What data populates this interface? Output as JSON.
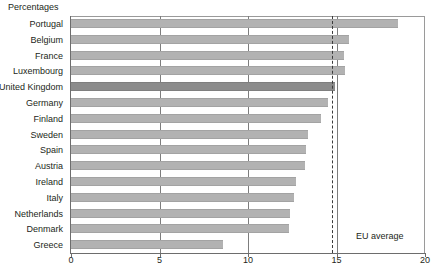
{
  "chart_data": {
    "type": "bar",
    "orientation": "horizontal",
    "title": "Percentages",
    "xlabel": "",
    "ylabel": "",
    "categories": [
      "Portugal",
      "Belgium",
      "France",
      "Luxembourg",
      "United Kingdom",
      "Germany",
      "Finland",
      "Sweden",
      "Spain",
      "Austria",
      "Ireland",
      "Italy",
      "Netherlands",
      "Denmark",
      "Greece"
    ],
    "values": [
      18.5,
      15.7,
      15.4,
      15.5,
      14.9,
      14.5,
      14.1,
      13.4,
      13.3,
      13.2,
      12.7,
      12.6,
      12.4,
      12.3,
      8.6
    ],
    "highlight_category": "United Kingdom",
    "xlim": [
      0,
      20
    ],
    "xticks": [
      0,
      5,
      10,
      15,
      20
    ],
    "xticklabels": [
      "0",
      "5",
      "10",
      "15",
      "20"
    ],
    "grid": true,
    "grid_axis": "x",
    "legend": false,
    "annotations": [
      {
        "name": "eu-average",
        "label": "EU average",
        "value": 14.75,
        "style": "dashed-vertical-line"
      }
    ],
    "colors": {
      "bar": "#b2b2b2",
      "bar_highlight": "#8c8c8c",
      "gridline": "#7d7d7d",
      "axis": "#6d6d6d",
      "text": "#231f20",
      "annotation_line": "#3b3b3b",
      "background": "#ffffff"
    }
  }
}
